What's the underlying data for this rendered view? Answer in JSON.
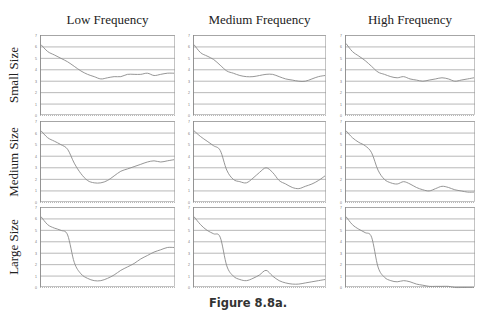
{
  "figure": {
    "caption": "Figure 8.8a.",
    "columns": [
      "Low Frequency",
      "Medium Frequency",
      "High Frequency"
    ],
    "rows": [
      "Small Size",
      "Medium Size",
      "Large Size"
    ],
    "line_color": "#8a8a8a",
    "grid_color": "#9a9a9a"
  },
  "chart_data": [
    {
      "type": "line",
      "row": "Small Size",
      "column": "Low Frequency",
      "ylim": [
        0,
        7
      ],
      "yticks": [
        0,
        1,
        2,
        3,
        4,
        5,
        6,
        7
      ],
      "grid": true,
      "x": [
        0,
        1,
        2,
        3,
        4,
        5,
        6,
        7,
        8,
        9,
        10,
        11,
        12,
        13,
        14,
        15,
        16,
        17,
        18,
        19,
        20
      ],
      "values": [
        6.2,
        5.6,
        5.3,
        5.0,
        4.7,
        4.3,
        3.9,
        3.6,
        3.4,
        3.2,
        3.3,
        3.4,
        3.4,
        3.6,
        3.6,
        3.6,
        3.7,
        3.5,
        3.6,
        3.7,
        3.7
      ]
    },
    {
      "type": "line",
      "row": "Small Size",
      "column": "Medium Frequency",
      "ylim": [
        0,
        7
      ],
      "yticks": [
        0,
        1,
        2,
        3,
        4,
        5,
        6,
        7
      ],
      "grid": true,
      "x": [
        0,
        1,
        2,
        3,
        4,
        5,
        6,
        7,
        8,
        9,
        10,
        11,
        12,
        13,
        14,
        15,
        16,
        17,
        18,
        19,
        20
      ],
      "values": [
        6.2,
        5.5,
        5.2,
        4.9,
        4.4,
        3.9,
        3.7,
        3.5,
        3.4,
        3.4,
        3.5,
        3.6,
        3.6,
        3.4,
        3.2,
        3.1,
        3.0,
        3.0,
        3.2,
        3.4,
        3.5
      ]
    },
    {
      "type": "line",
      "row": "Small Size",
      "column": "High Frequency",
      "ylim": [
        0,
        7
      ],
      "yticks": [
        0,
        1,
        2,
        3,
        4,
        5,
        6,
        7
      ],
      "grid": true,
      "x": [
        0,
        1,
        2,
        3,
        4,
        5,
        6,
        7,
        8,
        9,
        10,
        11,
        12,
        13,
        14,
        15,
        16,
        17,
        18,
        19,
        20
      ],
      "values": [
        6.3,
        5.6,
        5.2,
        4.8,
        4.3,
        3.8,
        3.6,
        3.4,
        3.3,
        3.4,
        3.2,
        3.1,
        3.0,
        3.1,
        3.2,
        3.3,
        3.2,
        3.0,
        3.1,
        3.2,
        3.3
      ]
    },
    {
      "type": "line",
      "row": "Medium Size",
      "column": "Low Frequency",
      "ylim": [
        0,
        7
      ],
      "yticks": [
        0,
        1,
        2,
        3,
        4,
        5,
        6,
        7
      ],
      "grid": true,
      "x": [
        0,
        1,
        2,
        3,
        4,
        5,
        6,
        7,
        8,
        9,
        10,
        11,
        12,
        13,
        14,
        15,
        16,
        17,
        18,
        19,
        20
      ],
      "values": [
        6.2,
        5.6,
        5.3,
        5.0,
        4.6,
        3.4,
        2.5,
        1.9,
        1.7,
        1.7,
        1.9,
        2.3,
        2.7,
        2.9,
        3.1,
        3.3,
        3.5,
        3.6,
        3.5,
        3.6,
        3.7
      ]
    },
    {
      "type": "line",
      "row": "Medium Size",
      "column": "Medium Frequency",
      "ylim": [
        0,
        7
      ],
      "yticks": [
        0,
        1,
        2,
        3,
        4,
        5,
        6,
        7
      ],
      "grid": true,
      "x": [
        0,
        1,
        2,
        3,
        4,
        5,
        6,
        7,
        8,
        9,
        10,
        11,
        12,
        13,
        14,
        15,
        16,
        17,
        18,
        19,
        20
      ],
      "values": [
        6.2,
        5.7,
        5.3,
        4.9,
        4.5,
        2.8,
        2.0,
        1.8,
        1.7,
        2.1,
        2.6,
        3.0,
        2.6,
        1.9,
        1.6,
        1.3,
        1.2,
        1.4,
        1.6,
        1.9,
        2.3
      ]
    },
    {
      "type": "line",
      "row": "Medium Size",
      "column": "High Frequency",
      "ylim": [
        0,
        7
      ],
      "yticks": [
        0,
        1,
        2,
        3,
        4,
        5,
        6,
        7
      ],
      "grid": true,
      "x": [
        0,
        1,
        2,
        3,
        4,
        5,
        6,
        7,
        8,
        9,
        10,
        11,
        12,
        13,
        14,
        15,
        16,
        17,
        18,
        19,
        20
      ],
      "values": [
        6.2,
        5.6,
        5.2,
        4.9,
        4.3,
        2.8,
        2.0,
        1.7,
        1.6,
        1.8,
        1.6,
        1.3,
        1.1,
        1.0,
        1.2,
        1.4,
        1.3,
        1.1,
        1.0,
        0.9,
        0.9
      ]
    },
    {
      "type": "line",
      "row": "Large Size",
      "column": "Low Frequency",
      "ylim": [
        0,
        7
      ],
      "yticks": [
        0,
        1,
        2,
        3,
        4,
        5,
        6,
        7
      ],
      "grid": true,
      "x": [
        0,
        1,
        2,
        3,
        4,
        5,
        6,
        7,
        8,
        9,
        10,
        11,
        12,
        13,
        14,
        15,
        16,
        17,
        18,
        19,
        20
      ],
      "values": [
        6.2,
        5.5,
        5.2,
        5.0,
        4.6,
        2.2,
        1.2,
        0.8,
        0.6,
        0.6,
        0.8,
        1.1,
        1.5,
        1.8,
        2.1,
        2.5,
        2.8,
        3.1,
        3.3,
        3.5,
        3.5
      ]
    },
    {
      "type": "line",
      "row": "Large Size",
      "column": "Medium Frequency",
      "ylim": [
        0,
        7
      ],
      "yticks": [
        0,
        1,
        2,
        3,
        4,
        5,
        6,
        7
      ],
      "grid": true,
      "x": [
        0,
        1,
        2,
        3,
        4,
        5,
        6,
        7,
        8,
        9,
        10,
        11,
        12,
        13,
        14,
        15,
        16,
        17,
        18,
        19,
        20
      ],
      "values": [
        6.2,
        5.5,
        5.0,
        4.7,
        4.4,
        1.9,
        1.0,
        0.7,
        0.6,
        0.8,
        1.1,
        1.5,
        1.0,
        0.6,
        0.4,
        0.3,
        0.3,
        0.4,
        0.5,
        0.6,
        0.7
      ]
    },
    {
      "type": "line",
      "row": "Large Size",
      "column": "High Frequency",
      "ylim": [
        0,
        7
      ],
      "yticks": [
        0,
        1,
        2,
        3,
        4,
        5,
        6,
        7
      ],
      "grid": true,
      "x": [
        0,
        1,
        2,
        3,
        4,
        5,
        6,
        7,
        8,
        9,
        10,
        11,
        12,
        13,
        14,
        15,
        16,
        17,
        18,
        19,
        20
      ],
      "values": [
        6.2,
        5.5,
        5.1,
        4.8,
        4.4,
        1.8,
        0.9,
        0.6,
        0.5,
        0.6,
        0.5,
        0.3,
        0.2,
        0.1,
        0.1,
        0.1,
        0.1,
        0.0,
        0.0,
        0.0,
        0.0
      ]
    }
  ]
}
